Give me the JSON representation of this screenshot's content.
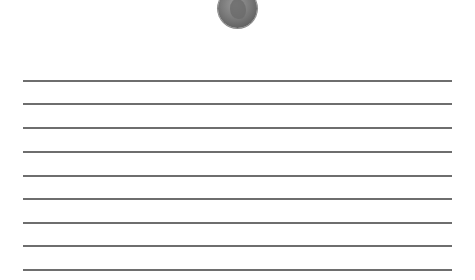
{
  "image": {
    "icon": "penny-coin-icon",
    "description": "Lincoln penny coin at top center"
  },
  "writing_lines": {
    "count": 9,
    "y_positions": [
      80,
      103,
      127,
      151,
      175,
      198,
      222,
      245,
      269
    ],
    "color": "#6e6e6e"
  }
}
